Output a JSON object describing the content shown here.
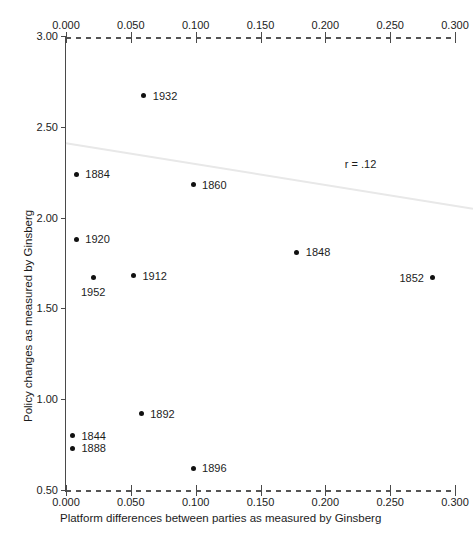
{
  "chart_data": {
    "type": "scatter",
    "title": "",
    "xlabel": "Platform differences between parties as measured by Ginsberg",
    "ylabel": "Policy changes as measured by Ginsberg",
    "xlim": [
      0.0,
      0.3
    ],
    "ylim": [
      0.5,
      3.0
    ],
    "grid": false,
    "legend": null,
    "x_ticks": [
      "0.000",
      "0.050",
      "0.100",
      "0.150",
      "0.200",
      "0.250",
      "0.300"
    ],
    "x_tick_values": [
      0.0,
      0.05,
      0.1,
      0.15,
      0.2,
      0.25,
      0.3
    ],
    "y_ticks": [
      "3.00",
      "2.50",
      "2.00",
      "1.50",
      "1.00",
      "0.50"
    ],
    "y_tick_values": [
      3.0,
      2.5,
      2.0,
      1.5,
      1.0,
      0.5
    ],
    "annotations": [
      {
        "text": "r = .12",
        "x": 0.215,
        "y": 2.32
      }
    ],
    "trendline": {
      "x0": 0.0,
      "y0": 2.41,
      "x1": 0.3,
      "y1": 2.06,
      "color": "#e8e8e8"
    },
    "points": [
      {
        "label": "1932",
        "x": 0.06,
        "y": 2.67,
        "label_pos": "right"
      },
      {
        "label": "1884",
        "x": 0.008,
        "y": 2.24,
        "label_pos": "right"
      },
      {
        "label": "1860",
        "x": 0.098,
        "y": 2.18,
        "label_pos": "right"
      },
      {
        "label": "1920",
        "x": 0.008,
        "y": 1.88,
        "label_pos": "right"
      },
      {
        "label": "1848",
        "x": 0.178,
        "y": 1.81,
        "label_pos": "right"
      },
      {
        "label": "1912",
        "x": 0.052,
        "y": 1.68,
        "label_pos": "right"
      },
      {
        "label": "1952",
        "x": 0.021,
        "y": 1.67,
        "label_pos": "below"
      },
      {
        "label": "1852",
        "x": 0.283,
        "y": 1.67,
        "label_pos": "left"
      },
      {
        "label": "1892",
        "x": 0.058,
        "y": 0.92,
        "label_pos": "right"
      },
      {
        "label": "1844",
        "x": 0.005,
        "y": 0.8,
        "label_pos": "right"
      },
      {
        "label": "1888",
        "x": 0.005,
        "y": 0.73,
        "label_pos": "right"
      },
      {
        "label": "1896",
        "x": 0.098,
        "y": 0.62,
        "label_pos": "right"
      }
    ]
  }
}
